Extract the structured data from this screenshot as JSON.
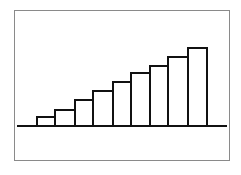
{
  "chart_data": {
    "type": "bar",
    "title": "",
    "xlabel": "",
    "ylabel": "",
    "categories": [
      "1",
      "2",
      "3",
      "4",
      "5",
      "6",
      "7",
      "8",
      "9"
    ],
    "values": [
      9,
      16,
      26,
      35,
      44,
      53,
      60,
      69,
      78
    ],
    "ylim": [
      0,
      90
    ],
    "grid": false,
    "legend": null,
    "tick_labels_visible": false,
    "bar_fill": "#ffffff",
    "bar_stroke": "#111111",
    "baseline_color": "#111111",
    "frame_color": "#8a8a8a",
    "layout": {
      "baseline_y": 126,
      "baseline_x0": 17,
      "baseline_x1": 227,
      "bar_edges": [
        37,
        55,
        75,
        93,
        113,
        131,
        150,
        168,
        188,
        207
      ]
    }
  }
}
